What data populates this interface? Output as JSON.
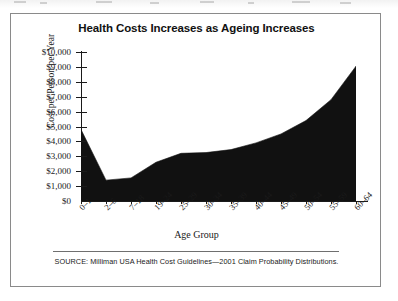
{
  "figure": {
    "title": "Health Costs Increases as Ageing Increases",
    "source_note": "SOURCE: Milliman USA Health Cost Guidelines—2001 Claim Probability Distributions."
  },
  "chart_data": {
    "type": "area",
    "title": "Health Costs Increases as Ageing Increases",
    "xlabel": "Age Group",
    "ylabel": "Cost per Person per Year",
    "categories": [
      "0–1",
      "2–6",
      "7–18",
      "19–24",
      "25–29",
      "30–34",
      "35–39",
      "40–44",
      "45–49",
      "50–54",
      "55–59",
      "60–64"
    ],
    "values": [
      4800,
      1400,
      1550,
      2600,
      3200,
      3250,
      3450,
      3900,
      4500,
      5400,
      6800,
      9050
    ],
    "ylim": [
      0,
      10000
    ],
    "ytick_labels": [
      "$0",
      "$1,000",
      "$2,000",
      "$3,000",
      "$4,000",
      "$5,000",
      "$6,000",
      "$7,000",
      "$8,000",
      "$9,000",
      "$10,000"
    ],
    "ytick_values": [
      0,
      1000,
      2000,
      3000,
      4000,
      5000,
      6000,
      7000,
      8000,
      9000,
      10000
    ],
    "grid": false,
    "legend": null,
    "series_color": "#111111",
    "fill": true
  }
}
